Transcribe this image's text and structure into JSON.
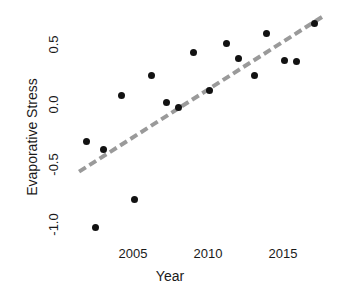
{
  "chart_data": {
    "type": "scatter",
    "title": "",
    "xlabel": "Year",
    "ylabel": "Evaporative Stress",
    "xlim": [
      2001.2,
      2017.6
    ],
    "ylim": [
      -1.12,
      0.78
    ],
    "grid": false,
    "legend": null,
    "xticks": [
      2005,
      2010,
      2015
    ],
    "xtick_labels": [
      "2005",
      "2010",
      "2015"
    ],
    "yticks": [
      0.5,
      0.0,
      -0.5,
      -1.0
    ],
    "ytick_labels": [
      "0.5",
      "0.0",
      "-0.5",
      "-1.0"
    ],
    "point_color": "#121212",
    "trend_color": "#9a9a9a",
    "trend_style": "dashed",
    "points": [
      {
        "x": 2001.9,
        "y": -0.3
      },
      {
        "x": 2002.5,
        "y": -1.02
      },
      {
        "x": 2003.0,
        "y": -0.37
      },
      {
        "x": 2004.2,
        "y": 0.08
      },
      {
        "x": 2005.1,
        "y": -0.79
      },
      {
        "x": 2006.2,
        "y": 0.25
      },
      {
        "x": 2007.2,
        "y": 0.02
      },
      {
        "x": 2008.0,
        "y": -0.02
      },
      {
        "x": 2009.0,
        "y": 0.44
      },
      {
        "x": 2010.1,
        "y": 0.12
      },
      {
        "x": 2011.2,
        "y": 0.51
      },
      {
        "x": 2012.0,
        "y": 0.39
      },
      {
        "x": 2013.1,
        "y": 0.25
      },
      {
        "x": 2013.9,
        "y": 0.6
      },
      {
        "x": 2015.1,
        "y": 0.37
      },
      {
        "x": 2015.9,
        "y": 0.36
      },
      {
        "x": 2017.1,
        "y": 0.68
      }
    ],
    "trend_line": {
      "x0": 2001.3,
      "y0": -0.54,
      "x1": 2017.5,
      "y1": 0.75
    }
  }
}
